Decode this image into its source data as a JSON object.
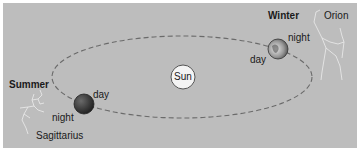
{
  "diagram": {
    "sun_label": "Sun",
    "summer": {
      "season_label": "Summer",
      "day_label": "day",
      "night_label": "night",
      "constellation_label": "Sagittarius"
    },
    "winter": {
      "season_label": "Winter",
      "day_label": "day",
      "night_label": "night",
      "constellation_label": "Orion"
    },
    "colors": {
      "background": "#bdbdbd",
      "orbit": "#6a6a6a",
      "sun_fill": "#f4f4f4",
      "earth_dark": "#3a3a3a",
      "constellation_lines": "#f2f2f2"
    }
  }
}
